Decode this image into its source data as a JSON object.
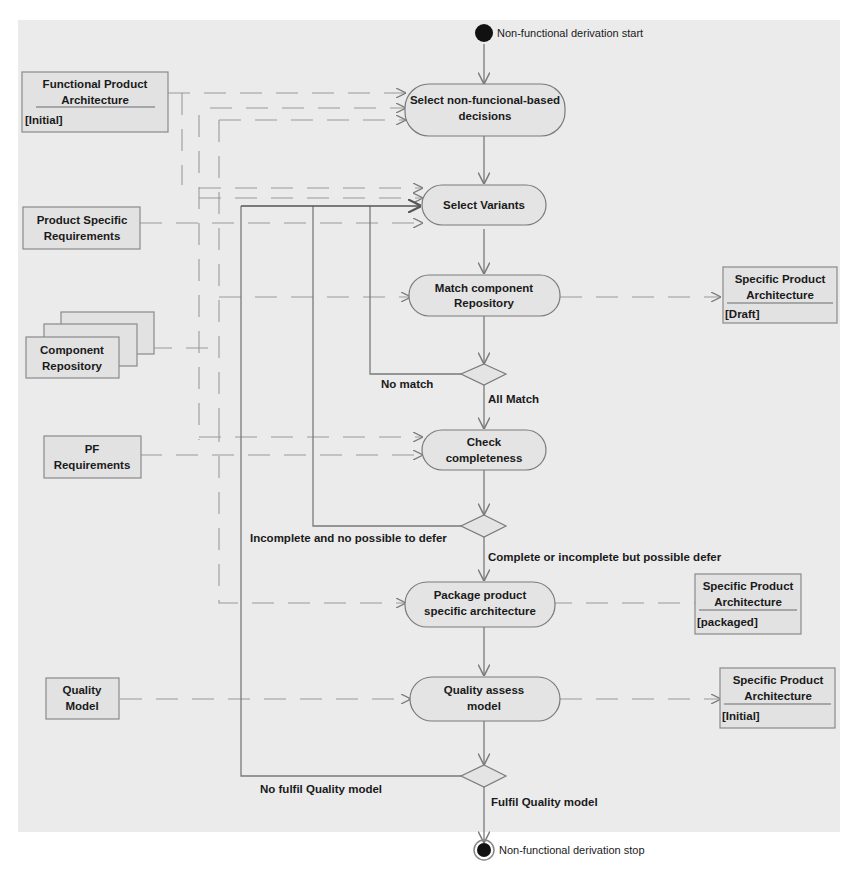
{
  "diagram": {
    "start_label": "Non-functional derivation start",
    "stop_label": "Non-functional derivation stop",
    "activities": [
      {
        "id": "a1",
        "line1": "Select non-funcional-based",
        "line2": "decisions"
      },
      {
        "id": "a2",
        "line1": "Select Variants",
        "line2": ""
      },
      {
        "id": "a3",
        "line1": "Match component",
        "line2": "Repository"
      },
      {
        "id": "a4",
        "line1": "Check",
        "line2": "completeness"
      },
      {
        "id": "a5",
        "line1": "Package product",
        "line2": "specific architecture"
      },
      {
        "id": "a6",
        "line1": "Quality assess",
        "line2": "model"
      }
    ],
    "inputs": [
      {
        "id": "i1",
        "line1": "Functional Product",
        "line2": "Architecture",
        "state": "[Initial]"
      },
      {
        "id": "i2",
        "line1": "Product Specific",
        "line2": "Requirements",
        "state": ""
      },
      {
        "id": "i3",
        "line1": "Component",
        "line2": "Repository",
        "state": ""
      },
      {
        "id": "i4",
        "line1": "PF",
        "line2": "Requirements",
        "state": ""
      },
      {
        "id": "i5",
        "line1": "Quality",
        "line2": "Model",
        "state": ""
      }
    ],
    "outputs": [
      {
        "id": "o1",
        "line1": "Specific Product",
        "line2": "Architecture",
        "state": "[Draft]"
      },
      {
        "id": "o2",
        "line1": "Specific Product",
        "line2": "Architecture",
        "state": "[packaged]"
      },
      {
        "id": "o3",
        "line1": "Specific Product",
        "line2": "Architecture",
        "state": "[Initial]"
      }
    ],
    "guards": {
      "no_match": "No match",
      "all_match": "All Match",
      "incomplete": "Incomplete and no possible to defer",
      "complete": "Complete or incomplete but possible defer",
      "no_fulfil": "No fulfil Quality model",
      "fulfil": "Fulfil Quality model"
    },
    "colors": {
      "panel": "#ebebeb",
      "node_fill": "#e4e4e4",
      "stroke": "#7a7a7a",
      "final_node": "#111111"
    }
  }
}
